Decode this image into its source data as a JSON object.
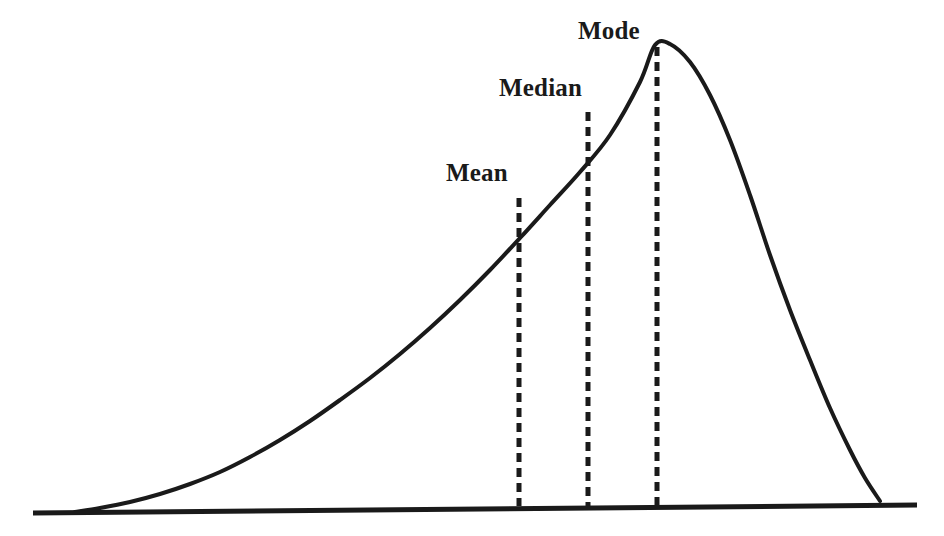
{
  "figure": {
    "background_color": "#ffffff",
    "stroke_color": "#1a1a1a",
    "title": ""
  },
  "annotations": {
    "mean": {
      "label": "Mean"
    },
    "median": {
      "label": "Median"
    },
    "mode": {
      "label": "Mode"
    }
  },
  "chart_data": {
    "type": "line",
    "title": "",
    "subtitle": "",
    "xlabel": "",
    "ylabel": "",
    "grid": false,
    "legend": null,
    "xlim": [
      0,
      944
    ],
    "ylim": [
      536,
      0
    ],
    "axis_baseline": {
      "name": "baseline",
      "x_start": 33,
      "y_start": 513,
      "x_end": 917,
      "y_end": 505
    },
    "series": [
      {
        "name": "distribution-curve",
        "style": "solid",
        "width": 4,
        "x": [
          75,
          100,
          130,
          160,
          190,
          220,
          250,
          280,
          310,
          340,
          370,
          400,
          430,
          460,
          490,
          520,
          550,
          580,
          610,
          640,
          655,
          670,
          690,
          710,
          730,
          750,
          770,
          790,
          810,
          830,
          850,
          865,
          880
        ],
        "y": [
          512,
          508,
          502,
          494,
          484,
          472,
          457,
          440,
          421,
          400,
          378,
          354,
          328,
          300,
          270,
          238,
          205,
          172,
          135,
          82,
          45,
          44,
          62,
          95,
          140,
          195,
          255,
          310,
          360,
          408,
          450,
          478,
          501
        ]
      }
    ],
    "reference_lines": [
      {
        "name": "mean-line",
        "label": "Mean",
        "style": "dashed",
        "x": 519,
        "y_top": 198,
        "y_bottom": 505,
        "dash_length": 9,
        "gap_length": 6,
        "width": 5
      },
      {
        "name": "median-line",
        "label": "Median",
        "style": "dashed",
        "x": 588,
        "y_top": 112,
        "y_bottom": 505,
        "dash_length": 9,
        "gap_length": 6,
        "width": 5
      },
      {
        "name": "mode-line",
        "label": "Mode",
        "style": "dashed",
        "x": 657,
        "y_top": 47,
        "y_bottom": 505,
        "dash_length": 9,
        "gap_length": 6,
        "width": 5
      }
    ],
    "ordering_note": "mean < median < mode",
    "tick_labels": {
      "x": [],
      "y": []
    }
  }
}
